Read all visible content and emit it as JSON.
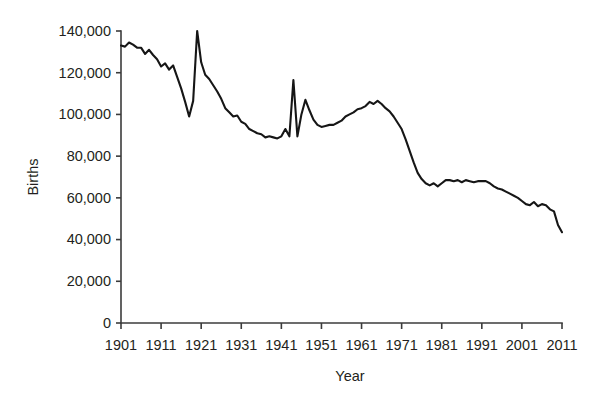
{
  "chart_data": {
    "type": "line",
    "title": "",
    "xlabel": "Year",
    "ylabel": "Births",
    "xlim": [
      1901,
      2011
    ],
    "ylim": [
      0,
      140000
    ],
    "grid": false,
    "legend": false,
    "xticks": [
      1901,
      1911,
      1921,
      1931,
      1941,
      1951,
      1961,
      1971,
      1981,
      1991,
      2001,
      2011
    ],
    "xtick_labels": [
      "1901",
      "1911",
      "1921",
      "1931",
      "1941",
      "1951",
      "1961",
      "1971",
      "1981",
      "1991",
      "2001",
      "2011"
    ],
    "yticks": [
      0,
      20000,
      40000,
      60000,
      80000,
      100000,
      120000,
      140000
    ],
    "ytick_labels": [
      "0",
      "20,000",
      "40,000",
      "60,000",
      "80,000",
      "100,000",
      "120,000",
      "140,000"
    ],
    "line_color": "#161616",
    "axis_color": "#3b3b3b",
    "series": [
      {
        "name": "Births",
        "x": [
          1901,
          1902,
          1903,
          1904,
          1905,
          1906,
          1907,
          1908,
          1909,
          1910,
          1911,
          1912,
          1913,
          1914,
          1915,
          1916,
          1917,
          1918,
          1919,
          1920,
          1921,
          1922,
          1923,
          1924,
          1925,
          1926,
          1927,
          1928,
          1929,
          1930,
          1931,
          1932,
          1933,
          1934,
          1935,
          1936,
          1937,
          1938,
          1939,
          1940,
          1941,
          1942,
          1943,
          1944,
          1945,
          1946,
          1947,
          1948,
          1949,
          1950,
          1951,
          1952,
          1953,
          1954,
          1955,
          1956,
          1957,
          1958,
          1959,
          1960,
          1961,
          1962,
          1963,
          1964,
          1965,
          1966,
          1967,
          1968,
          1969,
          1970,
          1971,
          1972,
          1973,
          1974,
          1975,
          1976,
          1977,
          1978,
          1979,
          1980,
          1981,
          1982,
          1983,
          1984,
          1985,
          1986,
          1987,
          1988,
          1989,
          1990,
          1991,
          1992,
          1993,
          1994,
          1995,
          1996,
          1997,
          1998,
          1999,
          2000,
          2001,
          2002,
          2003,
          2004,
          2005,
          2006,
          2007,
          2008,
          2009,
          2010,
          2011
        ],
        "values": [
          133000,
          132500,
          134500,
          133500,
          132000,
          132000,
          129000,
          131000,
          128500,
          126500,
          123000,
          124500,
          121500,
          123500,
          118000,
          112500,
          106000,
          99000,
          106500,
          140000,
          125000,
          119000,
          117000,
          114000,
          111000,
          107500,
          103000,
          101000,
          99000,
          99500,
          96500,
          95500,
          93000,
          92000,
          91000,
          90500,
          89000,
          89500,
          89000,
          88500,
          89500,
          93000,
          89500,
          116500,
          89500,
          100000,
          107000,
          102000,
          97500,
          95000,
          94000,
          94500,
          95000,
          95000,
          96000,
          97000,
          99000,
          100000,
          101000,
          102500,
          103000,
          104000,
          106000,
          105000,
          106500,
          105000,
          103000,
          101500,
          99000,
          96000,
          93000,
          88000,
          82500,
          77000,
          72000,
          69000,
          67000,
          66000,
          67000,
          65500,
          67000,
          68500,
          68500,
          68000,
          68500,
          67500,
          68500,
          68000,
          67500,
          68000,
          68000,
          68000,
          67000,
          65500,
          64500,
          64000,
          63000,
          62000,
          61000,
          60000,
          58500,
          57000,
          56500,
          58000,
          56000,
          57000,
          56500,
          54500,
          53500,
          47000,
          43500
        ]
      }
    ]
  },
  "figure": {
    "plot_left": 121,
    "plot_right": 562,
    "plot_top": 31,
    "plot_bottom": 323
  }
}
